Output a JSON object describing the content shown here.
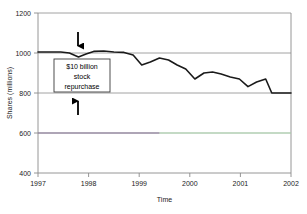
{
  "chart_data": {
    "type": "line",
    "title": "",
    "xlabel": "Time",
    "ylabel": "Shares (millions)",
    "xlim": [
      1997,
      2002
    ],
    "ylim": [
      400,
      1200
    ],
    "xticks": [
      "1997",
      "1998",
      "1999",
      "2000",
      "2001",
      "2002"
    ],
    "xtick_values": [
      1997,
      1998,
      1999,
      2000,
      2001,
      2002
    ],
    "yticks": [
      "400",
      "600",
      "800",
      "1000",
      "1200"
    ],
    "ytick_values": [
      400,
      600,
      800,
      1000,
      1200
    ],
    "grid": "horizontal",
    "legend": "none",
    "series": [
      {
        "name": "Shares outstanding",
        "color": "#1a1a1a",
        "x": [
          1997.0,
          1997.45,
          1997.62,
          1997.8,
          1997.95,
          1998.1,
          1998.3,
          1998.5,
          1998.7,
          1998.88,
          1999.05,
          1999.22,
          1999.4,
          1999.58,
          1999.75,
          1999.92,
          2000.1,
          2000.28,
          2000.45,
          2000.62,
          2000.8,
          2000.98,
          2001.15,
          2001.32,
          2001.5,
          2001.62,
          2002.0
        ],
        "y": [
          1005,
          1005,
          1000,
          980,
          995,
          1008,
          1010,
          1005,
          1003,
          990,
          940,
          955,
          975,
          965,
          940,
          920,
          870,
          900,
          905,
          895,
          880,
          870,
          832,
          855,
          870,
          800,
          800
        ]
      },
      {
        "name": "reference-line-left",
        "color": "#8c7a9c",
        "x": [
          1997.0,
          1999.4
        ],
        "y": [
          600,
          600
        ]
      },
      {
        "name": "reference-line-right",
        "color": "#b7e3b9",
        "x": [
          1999.4,
          2002.0
        ],
        "y": [
          600,
          600
        ]
      }
    ],
    "annotations": [
      {
        "id": "repurchase-callout",
        "lines": [
          "$10 billion",
          "stock",
          "repurchase"
        ],
        "box": true,
        "arrows": [
          {
            "id": "arrow-up-to-line",
            "direction": "down",
            "points_to_x": 1997.78,
            "points_to_y": 1000
          },
          {
            "id": "arrow-up-to-box",
            "direction": "up",
            "points_to_x": 1997.78,
            "points_to_y": 790
          }
        ]
      }
    ]
  },
  "annotation_text": {
    "line1": "$10 billion",
    "line2": "stock",
    "line3": "repurchase"
  },
  "axes": {
    "x_title": "Time",
    "y_title": "Shares (millions)",
    "x_tick_0": "1997",
    "x_tick_1": "1998",
    "x_tick_2": "1999",
    "x_tick_3": "2000",
    "x_tick_4": "2001",
    "x_tick_5": "2002",
    "y_tick_0": "400",
    "y_tick_1": "600",
    "y_tick_2": "800",
    "y_tick_3": "1000",
    "y_tick_4": "1200"
  },
  "colors": {
    "series_line": "#1a1a1a",
    "gridline": "#9a9a9a",
    "axis": "#8a8a8a",
    "ref_left": "#8c7a9c",
    "ref_right": "#b7e3b9",
    "background": "#ffffff"
  }
}
